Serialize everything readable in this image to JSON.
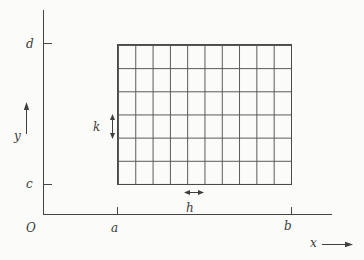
{
  "figure": {
    "background_color": "#fbfbf9",
    "line_color": "#454545",
    "origin_label": "O",
    "x_axis": {
      "label": "x",
      "tick_labels": [
        "a",
        "b"
      ]
    },
    "y_axis": {
      "label": "y",
      "tick_labels": [
        "d",
        "c"
      ]
    },
    "grid": {
      "columns": 10,
      "rows": 6,
      "x_range": [
        "a",
        "b"
      ],
      "y_range": [
        "c",
        "d"
      ],
      "cell_width_label": "h",
      "cell_height_label": "k"
    }
  }
}
